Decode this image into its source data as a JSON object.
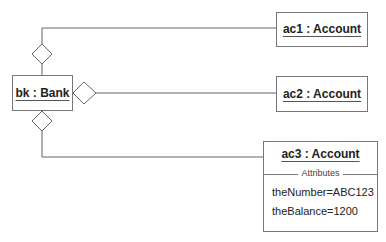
{
  "diagram": {
    "type": "UML object diagram",
    "objects": [
      {
        "id": "bk",
        "label": "bk : Bank"
      },
      {
        "id": "ac1",
        "label": "ac1 : Account"
      },
      {
        "id": "ac2",
        "label": "ac2 : Account"
      },
      {
        "id": "ac3",
        "label": "ac3 : Account",
        "compartment_title": "Attributes",
        "attributes": [
          "theNumber=ABC123",
          "theBalance=1200"
        ]
      }
    ],
    "links": [
      {
        "from": "bk",
        "to": "ac1",
        "end": "aggregation-diamond",
        "side": "top"
      },
      {
        "from": "bk",
        "to": "ac2",
        "end": "aggregation-diamond",
        "side": "right"
      },
      {
        "from": "bk",
        "to": "ac3",
        "end": "aggregation-diamond",
        "side": "bottom"
      }
    ]
  }
}
